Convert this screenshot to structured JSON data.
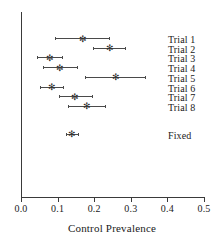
{
  "chart_data": {
    "type": "scatter",
    "subtype": "forest-plot",
    "title": "",
    "xlabel": "Control Prevalence",
    "ylabel": "",
    "xlim": [
      0.0,
      0.5
    ],
    "xticks": [
      "0.0",
      "0.1",
      "0.2",
      "0.3",
      "0.4",
      "0.5"
    ],
    "xtick_values": [
      0.0,
      0.1,
      0.2,
      0.3,
      0.4,
      0.5
    ],
    "grid": false,
    "legend": false,
    "marker_glyph": "✻",
    "line_color": "#4a4a4a",
    "marker_color": "#2b2b2b",
    "axis_color": "#3a3a3a",
    "rows": [
      {
        "label": "Trial 1",
        "estimate": 0.167,
        "lower": 0.093,
        "upper": 0.24
      },
      {
        "label": "Trial 2",
        "estimate": 0.243,
        "lower": 0.197,
        "upper": 0.284
      },
      {
        "label": "Trial 3",
        "estimate": 0.077,
        "lower": 0.044,
        "upper": 0.112
      },
      {
        "label": "Trial 4",
        "estimate": 0.104,
        "lower": 0.06,
        "upper": 0.153
      },
      {
        "label": "Trial 5",
        "estimate": 0.257,
        "lower": 0.175,
        "upper": 0.339
      },
      {
        "label": "Trial 6",
        "estimate": 0.082,
        "lower": 0.052,
        "upper": 0.115
      },
      {
        "label": "Trial 7",
        "estimate": 0.145,
        "lower": 0.104,
        "upper": 0.194
      },
      {
        "label": "Trial 8",
        "estimate": 0.178,
        "lower": 0.128,
        "upper": 0.23
      },
      {
        "label": "Fixed",
        "estimate": 0.137,
        "lower": 0.123,
        "upper": 0.156,
        "summary": true
      }
    ]
  }
}
